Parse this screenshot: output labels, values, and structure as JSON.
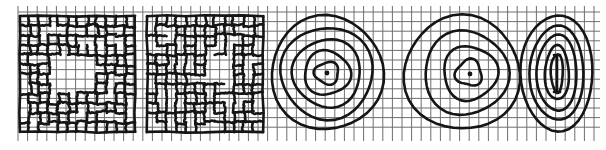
{
  "figure": {
    "width": 606,
    "height": 150,
    "background": "#ffffff",
    "ink_color": "#151515",
    "grid_color": "#6e6e6e",
    "graph_paper": {
      "x_start": 18,
      "x_end": 600,
      "y_start": 12,
      "y_end": 135,
      "spacing": 9.6,
      "tick_overhang": 6
    },
    "panels": [
      {
        "id": "panel-1",
        "kind": "distorted-grid",
        "description": "Bold hand-drawn grid with gaps in the center region",
        "box": [
          20,
          16,
          135,
          132
        ]
      },
      {
        "id": "panel-2",
        "kind": "distorted-grid",
        "description": "Bold hand-drawn grid with an open rectangle upper-right of center",
        "box": [
          147,
          16,
          263,
          132
        ]
      },
      {
        "id": "panel-3",
        "kind": "concentric-circles",
        "center": [
          327,
          73
        ],
        "radii": [
          [
            56,
            57
          ],
          [
            46,
            46
          ],
          [
            34,
            34
          ],
          [
            23,
            22
          ],
          [
            12,
            11
          ]
        ],
        "center_dot": [
          327,
          73
        ]
      },
      {
        "id": "panel-4",
        "kind": "eccentric-circles",
        "rings": [
          {
            "cx": 462,
            "cy": 73,
            "rx": 58,
            "ry": 57
          },
          {
            "cx": 466,
            "cy": 73,
            "rx": 42,
            "ry": 42
          },
          {
            "cx": 470,
            "cy": 73,
            "rx": 27,
            "ry": 27
          },
          {
            "cx": 469,
            "cy": 73,
            "rx": 13,
            "ry": 13
          }
        ],
        "center_dot": [
          470,
          74
        ]
      },
      {
        "id": "panel-5",
        "kind": "concentric-ellipses",
        "center": [
          557,
          73
        ],
        "radii": [
          [
            36,
            58
          ],
          [
            27,
            47
          ],
          [
            20,
            38
          ],
          [
            12,
            27
          ],
          [
            6,
            19
          ]
        ],
        "axis_line": [
          557,
          55,
          557,
          92
        ]
      }
    ]
  }
}
